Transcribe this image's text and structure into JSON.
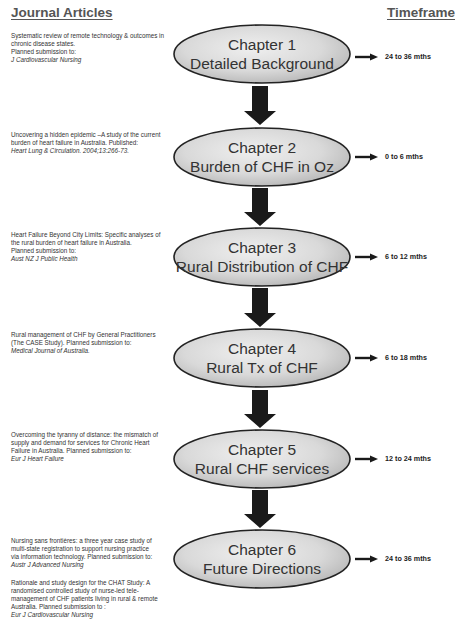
{
  "headers": {
    "left": "Journal Articles",
    "right": "Timeframe"
  },
  "articles": [
    {
      "lines": [
        "Systematic review of remote technology & outcomes in",
        "chronic disease states.",
        "Planned submission to:"
      ],
      "venue": "J Cardiovascular Nursing"
    },
    {
      "lines": [
        "Uncovering a hidden epidemic –A study of the current",
        "burden of heart failure in Australia. Published:"
      ],
      "venue": "Heart Lung & Circulation. 2004;13:266-73."
    },
    {
      "lines": [
        "Heart Failure Beyond City Limits: Specific analyses of",
        "the rural burden of heart failure in Australia.",
        "Planned submission to:"
      ],
      "venue": "Aust NZ J Public Health"
    },
    {
      "lines": [
        "Rural management of CHF by General Practitioners",
        "(The CASE Study). Planned submission to:"
      ],
      "venue": "Medical Journal of Australia."
    },
    {
      "lines": [
        "Overcoming the tyranny of distance: the mismatch of",
        "supply and demand for services for Chronic Heart",
        "Failure in Australia. Planned submission to:"
      ],
      "venue": "Eur J Heart Failure"
    },
    {
      "lines": [
        "Nursing sans frontières: a three year case study of",
        "multi-state registration to support nursing practice",
        "via information technology. Planned submission to:"
      ],
      "venue": "Austr J Advanced Nursing"
    },
    {
      "lines": [
        "Rationale and study design for the CHAT Study: A",
        "randomised controlled study of nurse-led tele-",
        "management of CHF patients living in rural & remote",
        "Australia. Planned submission to :"
      ],
      "venue": "Eur J Cardiovascular Nursing"
    }
  ],
  "chapters": [
    {
      "number": "Chapter 1",
      "title": "Detailed Background",
      "timeframe": "24 to 36 mths"
    },
    {
      "number": "Chapter 2",
      "title": "Burden of CHF in Oz",
      "timeframe": "0 to 6 mths"
    },
    {
      "number": "Chapter 3",
      "title": "Rural Distribution of CHF",
      "timeframe": "6 to 12 mths"
    },
    {
      "number": "Chapter 4",
      "title": "Rural Tx of CHF",
      "timeframe": "6 to 18 mths"
    },
    {
      "number": "Chapter 5",
      "title": "Rural CHF services",
      "timeframe": "12 to 24 mths"
    },
    {
      "number": "Chapter 6",
      "title": "Future Directions",
      "timeframe": "24 to 36 mths"
    }
  ],
  "colors": {
    "ellipse_fill_light": "#e8e8e8",
    "ellipse_fill_dark": "#bdbdbd",
    "ellipse_stroke": "#222222",
    "arrow": "#1a1a1a"
  }
}
